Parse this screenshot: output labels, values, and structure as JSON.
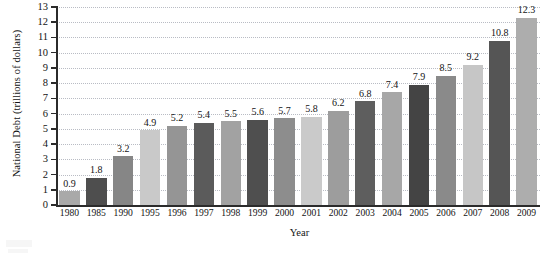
{
  "chart_data": {
    "type": "bar",
    "title": "",
    "xlabel": "Year",
    "ylabel": "National Debt (trillions of dollars)",
    "categories": [
      "1980",
      "1985",
      "1990",
      "1995",
      "1996",
      "1997",
      "1998",
      "1999",
      "2000",
      "2001",
      "2002",
      "2003",
      "2004",
      "2005",
      "2006",
      "2007",
      "2008",
      "2009"
    ],
    "values": [
      0.9,
      1.8,
      3.2,
      4.9,
      5.2,
      5.4,
      5.5,
      5.6,
      5.7,
      5.8,
      6.2,
      6.8,
      7.4,
      7.9,
      8.5,
      9.2,
      10.8,
      12.3
    ],
    "value_labels": [
      "0.9",
      "1.8",
      "3.2",
      "4.9",
      "5.2",
      "5.4",
      "5.5",
      "5.6",
      "5.7",
      "5.8",
      "6.2",
      "6.8",
      "7.4",
      "7.9",
      "8.5",
      "9.2",
      "10.8",
      "12.3"
    ],
    "ylim": [
      0,
      13
    ],
    "ytick_labels": [
      "0",
      "1",
      "2",
      "3",
      "4",
      "5",
      "6",
      "7",
      "8",
      "9",
      "10",
      "11",
      "12",
      "13"
    ],
    "ytick_values": [
      0,
      1,
      2,
      3,
      4,
      5,
      6,
      7,
      8,
      9,
      10,
      11,
      12,
      13
    ],
    "grid": true,
    "grid_axis": "y",
    "grid_style": "dotted",
    "legend": false,
    "legend_position": "none",
    "bar_colors": [
      "#a9a9a9",
      "#4e4e4e",
      "#868686",
      "#c9c9c9",
      "#959595",
      "#5b5b5b",
      "#a2a2a2",
      "#4f4f4f",
      "#8d8d8d",
      "#cacaca",
      "#9d9d9d",
      "#5e5e5e",
      "#a7a7a7",
      "#444444",
      "#8a8a8a",
      "#c6c6c6",
      "#555555",
      "#adadad"
    ],
    "axis_color": "#2b2b2b",
    "gridline_color": "#b9bcc4",
    "text_color": "#141414",
    "background_color": "#ffffff"
  }
}
